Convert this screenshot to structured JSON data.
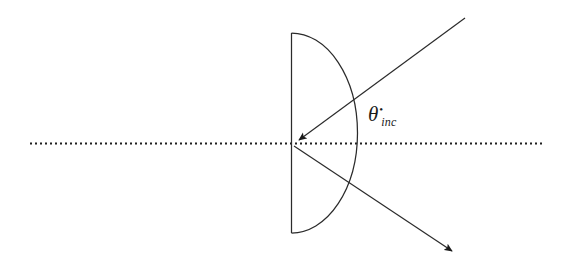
{
  "figure": {
    "background_color": "#ffffff",
    "stroke_color": "#2b2b2b",
    "axis_color": "#1f1f1f",
    "width": 570,
    "height": 274
  },
  "labels": {
    "angle": {
      "symbol": "θ",
      "prime": "•",
      "subscript": "inc",
      "full_text": "θinc",
      "x": 368,
      "y": 104
    }
  },
  "geometry": {
    "optical_axis": {
      "name": "optical-axis",
      "style": "dotted",
      "x1": 30,
      "y1": 143,
      "x2": 545,
      "y2": 143,
      "dot_size": 2,
      "dot_gap": 3
    },
    "semicircle": {
      "name": "half-disc-lens",
      "flat_edge_x": 291,
      "top_y": 33,
      "bottom_y": 233,
      "apex_x": 357,
      "center_y": 143,
      "rx": 66,
      "ry": 100
    },
    "vertex": {
      "name": "incidence-point",
      "x": 293,
      "y": 144
    },
    "incident_ray": {
      "name": "incident-ray",
      "from_x": 465,
      "from_y": 18,
      "to_x": 296,
      "to_y": 142,
      "arrowhead": "at-vertex"
    },
    "outgoing_ray": {
      "name": "outgoing-ray",
      "from_x": 294,
      "from_y": 146,
      "to_x": 457,
      "to_y": 255,
      "arrowhead": "at-end"
    }
  }
}
